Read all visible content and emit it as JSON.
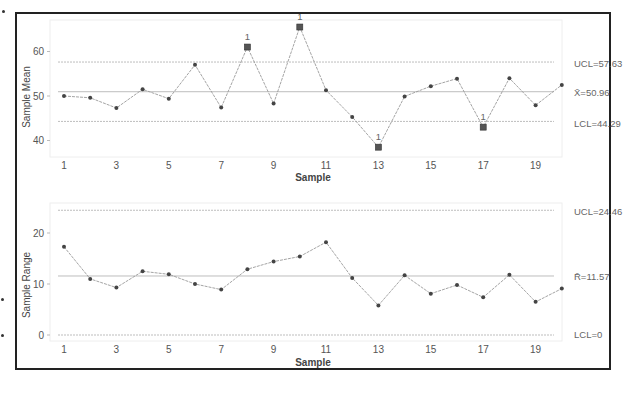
{
  "chart_data": [
    {
      "type": "line",
      "title": "",
      "xlabel": "Sample",
      "ylabel": "Sample Mean",
      "x": [
        1,
        2,
        3,
        4,
        5,
        6,
        7,
        8,
        9,
        10,
        11,
        12,
        13,
        14,
        15,
        16,
        17,
        18,
        19,
        20
      ],
      "x_tick_labels": [
        "1",
        "3",
        "5",
        "7",
        "9",
        "11",
        "13",
        "15",
        "17",
        "19"
      ],
      "y_tick_labels": [
        "40",
        "50",
        "60"
      ],
      "ylim": [
        36,
        68
      ],
      "series": [
        {
          "name": "Sample Mean",
          "values": [
            50.0,
            49.6,
            47.3,
            51.5,
            49.4,
            57.0,
            47.4,
            61.0,
            48.3,
            65.5,
            51.3,
            45.3,
            38.5,
            49.9,
            52.2,
            53.9,
            43.0,
            54.0,
            47.9,
            52.5
          ]
        }
      ],
      "out_of_control_points": [
        8,
        10,
        13,
        17
      ],
      "control_limits": {
        "UCL": 57.63,
        "center": 50.96,
        "LCL": 44.29
      },
      "annotations": [
        "UCL=57.63",
        "X̄=50.96",
        "LCL=44.29",
        "1",
        "1",
        "1",
        "1"
      ],
      "grid": false
    },
    {
      "type": "line",
      "title": "",
      "xlabel": "Sample",
      "ylabel": "Sample Range",
      "x": [
        1,
        2,
        3,
        4,
        5,
        6,
        7,
        8,
        9,
        10,
        11,
        12,
        13,
        14,
        15,
        16,
        17,
        18,
        19,
        20
      ],
      "x_tick_labels": [
        "1",
        "3",
        "5",
        "7",
        "9",
        "11",
        "13",
        "15",
        "17",
        "19"
      ],
      "y_tick_labels": [
        "0",
        "10",
        "20"
      ],
      "ylim": [
        -1,
        26
      ],
      "series": [
        {
          "name": "Sample Range",
          "values": [
            17.3,
            11.0,
            9.3,
            12.5,
            11.9,
            10.0,
            8.9,
            12.9,
            14.4,
            15.4,
            18.2,
            11.2,
            5.8,
            11.7,
            8.1,
            9.8,
            7.4,
            11.8,
            6.5,
            9.1
          ]
        }
      ],
      "control_limits": {
        "UCL": 24.46,
        "center": 11.57,
        "LCL": 0
      },
      "annotations": [
        "UCL=24.46",
        "R̄=11.57",
        "LCL=0"
      ],
      "grid": false
    }
  ],
  "labels": {
    "top_ylabel": "Sample Mean",
    "top_xlabel": "Sample",
    "top_ucl": "UCL=57.63",
    "top_center": "X̄=50.96",
    "top_lcl": "LCL=44.29",
    "bottom_ylabel": "Sample Range",
    "bottom_xlabel": "Sample",
    "bottom_ucl": "UCL=24.46",
    "bottom_center": "R̄=11.57",
    "bottom_lcl": "LCL=0",
    "flag": "1"
  },
  "colors": {
    "line": "#9a9a9a",
    "point": "#444444",
    "limit": "#bdbdbd",
    "frame": "#222222"
  }
}
